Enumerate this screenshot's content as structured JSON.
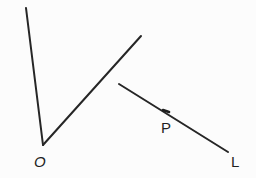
{
  "figure": {
    "background_color": "#fcfcfc",
    "stroke_color": "#262626",
    "canvas": {
      "width": 256,
      "height": 178
    }
  },
  "labels": [
    {
      "id": "O",
      "text": "O",
      "x": 41,
      "y": 162,
      "style": "oblique"
    },
    {
      "id": "P",
      "text": "P",
      "x": 168,
      "y": 128,
      "style": "upright"
    },
    {
      "id": "L",
      "text": "L",
      "x": 238,
      "y": 162,
      "style": "upright"
    }
  ],
  "shapes": {
    "angle": {
      "vertex_label": "O",
      "vertex": {
        "x": 43,
        "y": 145
      },
      "ray_left_end": {
        "x": 26,
        "y": 8
      },
      "ray_right_end": {
        "x": 141,
        "y": 36
      }
    },
    "segment": {
      "start": {
        "x": 119,
        "y": 84
      },
      "end": {
        "x": 228,
        "y": 152
      },
      "end_label": "L",
      "marked_point_label": "P",
      "marked_point": {
        "x": 166,
        "y": 111
      }
    }
  }
}
